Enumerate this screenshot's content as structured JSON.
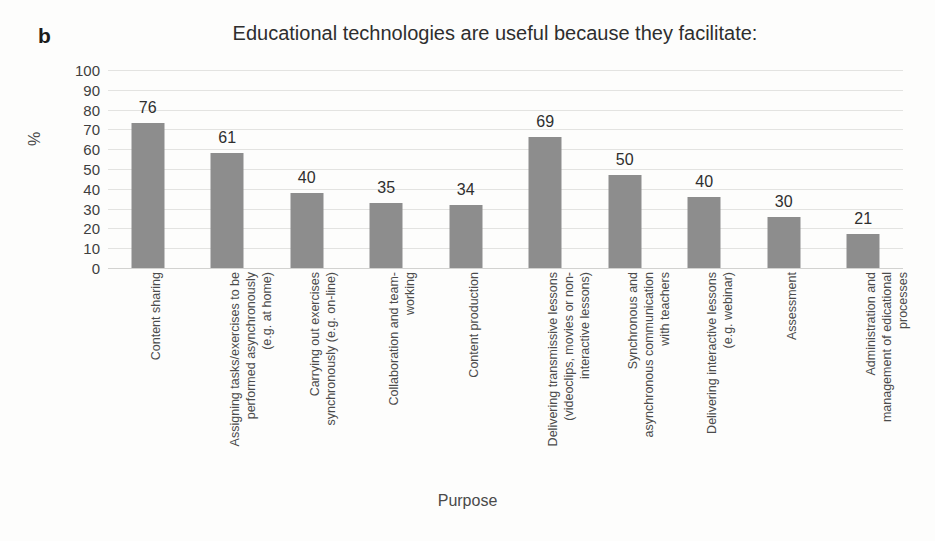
{
  "panel_label": "b",
  "chart_data": {
    "type": "bar",
    "title": "Educational technologies are useful because they facilitate:",
    "xlabel": "Purpose",
    "ylabel": "%",
    "ylim": [
      0,
      100
    ],
    "ytick_step": 10,
    "yticks": [
      100,
      90,
      80,
      70,
      60,
      50,
      40,
      30,
      20,
      10,
      0
    ],
    "grid": true,
    "legend": "none",
    "bar_color": "#8d8d8d",
    "gridline_color": "#e3e3e1",
    "categories": [
      "Content sharing",
      "Assigning tasks/exercises to be performed asynchronously (e.g. at home)",
      "Carrying out exercises synchronously (e.g. on-line)",
      "Collaboration and team-working",
      "Content production",
      "Delivering transmissive lessons (videoclips, movies or non-interactive lessons)",
      "Synchronous and asynchronous communication with teachers",
      "Delivering interactive lessons (e.g. webinar)",
      "Assessment",
      "Administration and management of edicational processes"
    ],
    "category_lines": [
      [
        "Content sharing"
      ],
      [
        "Assigning tasks/exercises to be",
        "performed asynchronously",
        "(e.g. at home)"
      ],
      [
        "Carrying out exercises",
        "synchronously (e.g. on-line)"
      ],
      [
        "Collaboration and team-",
        "working"
      ],
      [
        "Content production"
      ],
      [
        "Delivering transmissive lessons",
        "(videoclips, movies or non-",
        "interactive lessons)"
      ],
      [
        "Synchronous and",
        "asynchronous communication",
        "with teachers"
      ],
      [
        "Delivering interactive lessons",
        "(e.g. webinar)"
      ],
      [
        "Assessment"
      ],
      [
        "Administration and",
        "management of edicational",
        "processes"
      ]
    ],
    "values": [
      76,
      61,
      40,
      35,
      34,
      69,
      50,
      40,
      30,
      21
    ],
    "bar_pixel_values": [
      73,
      58,
      38,
      33,
      32,
      66,
      47,
      36,
      26,
      17
    ]
  }
}
